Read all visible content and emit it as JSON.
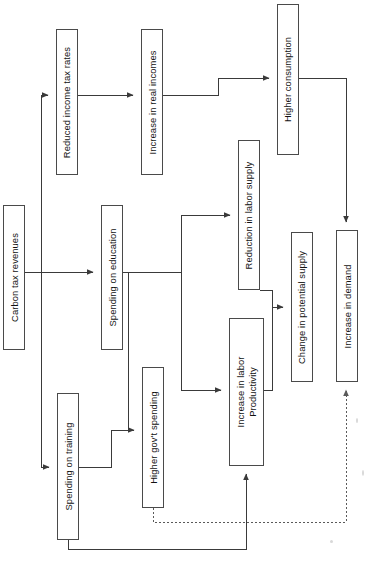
{
  "diagram": {
    "orientation": "rotated-90",
    "background_color": "#ffffff",
    "line_color": "#3a3a3a",
    "box_border_color": "#4a4a4a",
    "text_color": "#111111",
    "nodes": [
      {
        "id": "carbon-tax-revenues",
        "label": "Carbon tax revenues",
        "x": 3,
        "y": 205,
        "w": 22,
        "h": 145
      },
      {
        "id": "reduced-income-tax",
        "label": "Reduced income tax rates",
        "x": 56,
        "y": 29,
        "w": 22,
        "h": 146
      },
      {
        "id": "increase-real-incomes",
        "label": "Increase in real incomes",
        "x": 141,
        "y": 29,
        "w": 22,
        "h": 146
      },
      {
        "id": "higher-consumption",
        "label": "Higher consumption",
        "x": 277,
        "y": 4,
        "w": 22,
        "h": 151
      },
      {
        "id": "spending-education",
        "label": "Spending on education",
        "x": 101,
        "y": 205,
        "w": 22,
        "h": 145
      },
      {
        "id": "spending-training",
        "label": "Spending on training",
        "x": 57,
        "y": 393,
        "w": 22,
        "h": 147
      },
      {
        "id": "higher-govt-spending",
        "label": "Higher gov't spending",
        "x": 142,
        "y": 367,
        "w": 22,
        "h": 141
      },
      {
        "id": "reduction-labor-supply",
        "label": "Reduction in labor supply",
        "x": 238,
        "y": 140,
        "w": 22,
        "h": 150
      },
      {
        "id": "increase-labor-productivity",
        "label": "Increase in labor\nProductivity",
        "x": 229,
        "y": 318,
        "w": 35,
        "h": 148
      },
      {
        "id": "change-potential-supply",
        "label": "Change in potential supply",
        "x": 291,
        "y": 232,
        "w": 22,
        "h": 150
      },
      {
        "id": "increase-demand",
        "label": "Increase in demand",
        "x": 336,
        "y": 230,
        "w": 22,
        "h": 152
      }
    ],
    "edges": [
      {
        "id": "e1",
        "from": "carbon-tax-revenues",
        "to": "reduced-income-tax",
        "style": "solid"
      },
      {
        "id": "e2",
        "from": "carbon-tax-revenues",
        "to": "spending-education",
        "style": "solid"
      },
      {
        "id": "e3",
        "from": "carbon-tax-revenues",
        "to": "spending-training",
        "style": "solid"
      },
      {
        "id": "e4",
        "from": "reduced-income-tax",
        "to": "increase-real-incomes",
        "style": "solid"
      },
      {
        "id": "e5",
        "from": "increase-real-incomes",
        "to": "higher-consumption",
        "style": "solid"
      },
      {
        "id": "e6",
        "from": "higher-consumption",
        "to": "increase-demand",
        "style": "solid"
      },
      {
        "id": "e7",
        "from": "spending-education",
        "to": "reduction-labor-supply",
        "style": "solid"
      },
      {
        "id": "e8",
        "from": "spending-education",
        "to": "higher-govt-spending",
        "style": "solid"
      },
      {
        "id": "e9",
        "from": "spending-training",
        "to": "higher-govt-spending",
        "style": "solid"
      },
      {
        "id": "e10",
        "from": "spending-education",
        "to": "increase-labor-productivity",
        "style": "solid"
      },
      {
        "id": "e11",
        "from": "spending-training",
        "to": "increase-labor-productivity",
        "style": "solid"
      },
      {
        "id": "e12",
        "from": "reduction-labor-supply",
        "to": "change-potential-supply",
        "style": "solid"
      },
      {
        "id": "e13",
        "from": "increase-labor-productivity",
        "to": "change-potential-supply",
        "style": "solid"
      },
      {
        "id": "e14",
        "from": "higher-govt-spending",
        "to": "increase-demand",
        "style": "dotted"
      }
    ]
  }
}
